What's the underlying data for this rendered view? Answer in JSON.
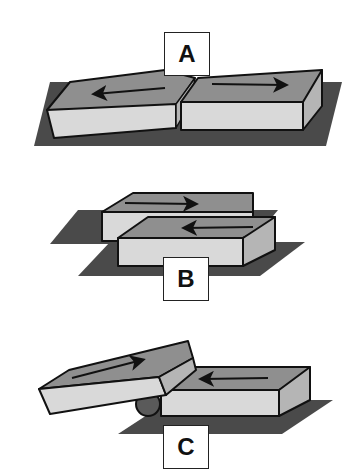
{
  "diagram": {
    "type": "fault-types-blocks",
    "panels": [
      {
        "id": "A",
        "label": "A",
        "motion": "divergent",
        "arrows": [
          "left",
          "right"
        ]
      },
      {
        "id": "B",
        "label": "B",
        "motion": "transform",
        "arrows": [
          "right",
          "left"
        ]
      },
      {
        "id": "C",
        "label": "C",
        "motion": "convergent",
        "arrows": [
          "right",
          "left"
        ]
      }
    ],
    "colors": {
      "outline": "#111111",
      "top_face": "#8f8f8f",
      "front_face": "#d9d9d9",
      "side_face": "#b5b5b5",
      "ground": "#4a4a4a",
      "ball": "#5a5a5a"
    }
  }
}
